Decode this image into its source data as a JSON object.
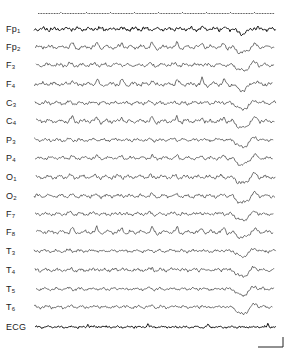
{
  "chart_data": {
    "type": "line",
    "title": "",
    "xlabel": "",
    "ylabel": "",
    "time_marker_row": true,
    "channels": [
      {
        "name": "Fp1",
        "base": "Fp",
        "sub": "1",
        "y": 29,
        "dip": 0.6,
        "spikes": 0.2,
        "amp": 2.2,
        "bold": true
      },
      {
        "name": "Fp2",
        "base": "Fp",
        "sub": "2",
        "y": 47,
        "dip": 0.8,
        "spikes": 1.0,
        "amp": 2.0,
        "bold": false
      },
      {
        "name": "F3",
        "base": "F",
        "sub": "3",
        "y": 65,
        "dip": 0.8,
        "spikes": 0.3,
        "amp": 1.8,
        "bold": false
      },
      {
        "name": "F4",
        "base": "F",
        "sub": "4",
        "y": 84,
        "dip": 0.9,
        "spikes": 1.0,
        "amp": 2.0,
        "bold": false
      },
      {
        "name": "C3",
        "base": "C",
        "sub": "3",
        "y": 103,
        "dip": 0.9,
        "spikes": 0.3,
        "amp": 1.8,
        "bold": false
      },
      {
        "name": "C4",
        "base": "C",
        "sub": "4",
        "y": 121,
        "dip": 1.0,
        "spikes": 0.9,
        "amp": 2.0,
        "bold": false
      },
      {
        "name": "P3",
        "base": "P",
        "sub": "3",
        "y": 140,
        "dip": 1.0,
        "spikes": 0.3,
        "amp": 1.6,
        "bold": false
      },
      {
        "name": "P4",
        "base": "P",
        "sub": "4",
        "y": 158,
        "dip": 1.0,
        "spikes": 0.5,
        "amp": 1.6,
        "bold": false
      },
      {
        "name": "O1",
        "base": "O",
        "sub": "1",
        "y": 177,
        "dip": 0.9,
        "spikes": 0.3,
        "amp": 2.0,
        "bold": false
      },
      {
        "name": "O2",
        "base": "O",
        "sub": "2",
        "y": 196,
        "dip": 1.0,
        "spikes": 0.3,
        "amp": 1.8,
        "bold": false
      },
      {
        "name": "F7",
        "base": "F",
        "sub": "7",
        "y": 214,
        "dip": 0.9,
        "spikes": 0.4,
        "amp": 1.6,
        "bold": false
      },
      {
        "name": "F8",
        "base": "F",
        "sub": "8",
        "y": 232,
        "dip": 0.8,
        "spikes": 1.0,
        "amp": 1.8,
        "bold": false
      },
      {
        "name": "T3",
        "base": "T",
        "sub": "3",
        "y": 251,
        "dip": 0.8,
        "spikes": 0.3,
        "amp": 1.6,
        "bold": false
      },
      {
        "name": "T4",
        "base": "T",
        "sub": "4",
        "y": 270,
        "dip": 0.9,
        "spikes": 0.5,
        "amp": 1.8,
        "bold": false
      },
      {
        "name": "T5",
        "base": "T",
        "sub": "5",
        "y": 289,
        "dip": 0.9,
        "spikes": 0.3,
        "amp": 1.6,
        "bold": false
      },
      {
        "name": "T6",
        "base": "T",
        "sub": "6",
        "y": 307,
        "dip": 1.0,
        "spikes": 0.4,
        "amp": 1.6,
        "bold": false
      },
      {
        "name": "ECG",
        "base": "ECG",
        "sub": "",
        "y": 327,
        "dip": 0.0,
        "spikes": 0.0,
        "amp": 0.9,
        "bold": true,
        "ecg": true
      }
    ],
    "trace_x_start": 34,
    "trace_x_end": 276,
    "slow_wave_x": 243,
    "scale_bar": {
      "x1": 258,
      "x2": 283,
      "y_top": 337,
      "y_bottom": 347
    },
    "legend": []
  }
}
